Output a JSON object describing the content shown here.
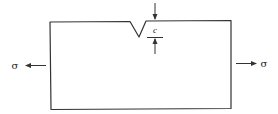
{
  "diagram": {
    "type": "notched plate under tension",
    "stress_label_left": "σ",
    "stress_label_right": "σ",
    "crack_depth_label": "c",
    "colors": {
      "line": "#333333",
      "background": "#ffffff"
    }
  }
}
